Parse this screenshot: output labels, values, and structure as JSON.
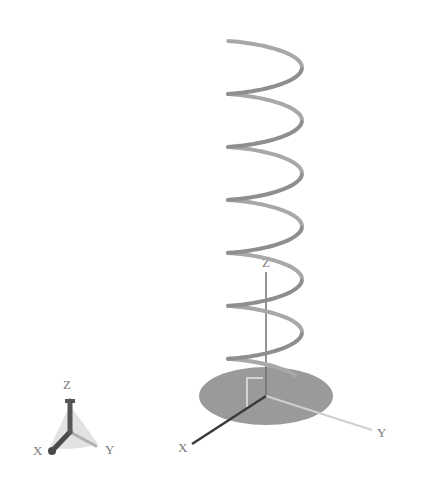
{
  "scene": {
    "width": 422,
    "height": 486,
    "background": "#ffffff"
  },
  "helix": {
    "turns": 6.4,
    "center_x": 265,
    "radius_x": 37,
    "radius_y": 8,
    "top_y": 33,
    "bottom_y": 372,
    "stroke_color": "#8e8e8e",
    "stroke_width": 4
  },
  "base_disk": {
    "cx": 266,
    "cy": 396,
    "rx": 67,
    "ry": 29,
    "fill": "#9a9a9a"
  },
  "main_axes": {
    "origin": [
      266,
      396
    ],
    "x_end": [
      192,
      444
    ],
    "y_end": [
      372,
      430
    ],
    "z_end": [
      266,
      272
    ],
    "x_color": "#3a3a3a",
    "y_color": "#cfcfcf",
    "z_color": "#707070",
    "labels": {
      "x": {
        "text": "X",
        "pos": [
          178,
          452
        ]
      },
      "y": {
        "text": "Y",
        "pos": [
          377,
          437
        ]
      },
      "z": {
        "text": "Z",
        "pos": [
          262,
          267
        ]
      }
    }
  },
  "bracket": {
    "points": [
      [
        247,
        408
      ],
      [
        247,
        378
      ],
      [
        263,
        378
      ]
    ],
    "color": "#d4d4d4"
  },
  "orientation_triad": {
    "origin": [
      70,
      432
    ],
    "x_end": [
      52,
      451
    ],
    "y_end": [
      96,
      446
    ],
    "z_end": [
      70,
      401
    ],
    "cone_fill": "#cfcfcf",
    "x_color": "#4a4a4a",
    "y_color": "#b0b0b0",
    "z_color": "#555555",
    "labels": {
      "x": {
        "text": "X",
        "pos": [
          33,
          455
        ]
      },
      "y": {
        "text": "Y",
        "pos": [
          105,
          454
        ]
      },
      "z": {
        "text": "Z",
        "pos": [
          63,
          389
        ]
      }
    }
  },
  "label_color": "#777777"
}
